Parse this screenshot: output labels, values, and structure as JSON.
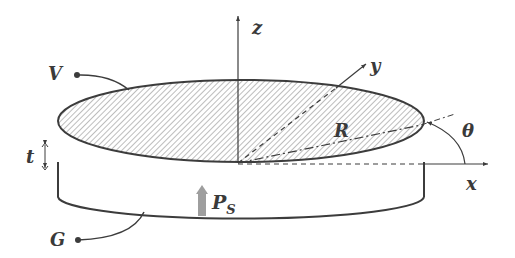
{
  "diagram": {
    "labels": {
      "z_axis": "z",
      "y_axis": "y",
      "x_axis": "x",
      "radius": "R",
      "angle": "θ",
      "thickness": "t",
      "top_electrode": "V",
      "bottom_electrode": "G",
      "pressure_main": "P",
      "pressure_sub": "S"
    },
    "colors": {
      "stroke": "#3c3c3c",
      "hatch": "#9a9a9a",
      "pressure_arrow": "#9e9e9e",
      "background": "#ffffff"
    }
  }
}
